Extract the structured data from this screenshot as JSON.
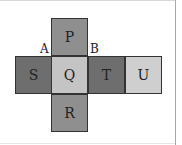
{
  "diagram": {
    "faces": [
      {
        "id": "P",
        "label": "P",
        "color": "#8f8f8f",
        "x": 51,
        "y": 18
      },
      {
        "id": "S",
        "label": "S",
        "color": "#6e6e6e",
        "x": 15,
        "y": 56
      },
      {
        "id": "Q",
        "label": "Q",
        "color": "#c4c4c4",
        "x": 51,
        "y": 56
      },
      {
        "id": "T",
        "label": "T",
        "color": "#6e6e6e",
        "x": 88,
        "y": 56
      },
      {
        "id": "U",
        "label": "U",
        "color": "#cfcfcf",
        "x": 125,
        "y": 56
      },
      {
        "id": "R",
        "label": "R",
        "color": "#8f8f8f",
        "x": 51,
        "y": 94
      }
    ],
    "vertex_labels": [
      {
        "id": "A",
        "label": "A",
        "x": 40,
        "y": 43
      },
      {
        "id": "B",
        "label": "B",
        "x": 90,
        "y": 43
      }
    ]
  }
}
